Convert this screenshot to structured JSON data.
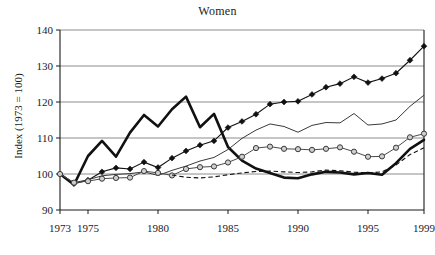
{
  "chart_data": {
    "type": "line",
    "title": "Women",
    "xlabel": "",
    "ylabel": "Index (1973 = 100)",
    "xlim": [
      1973,
      1999
    ],
    "ylim": [
      90,
      140
    ],
    "grid": true,
    "legend": "none",
    "y_ticks": [
      "90",
      "100",
      "110",
      "120",
      "130",
      "140"
    ],
    "x_ticks": [
      "1973",
      "1975",
      "1980",
      "1985",
      "1990",
      "1995",
      "1999"
    ],
    "x": [
      1973,
      1974,
      1975,
      1976,
      1977,
      1978,
      1979,
      1980,
      1981,
      1982,
      1983,
      1984,
      1985,
      1986,
      1987,
      1988,
      1989,
      1990,
      1991,
      1992,
      1993,
      1994,
      1995,
      1996,
      1997,
      1998,
      1999
    ],
    "series": [
      {
        "name": "thick-solid",
        "marker": "none",
        "color": "#111111",
        "values": [
          100.0,
          97.0,
          105.0,
          109.2,
          104.8,
          111.5,
          116.4,
          113.2,
          118.0,
          121.5,
          113.0,
          116.7,
          107.5,
          103.7,
          101.5,
          100.3,
          99.0,
          98.8,
          99.9,
          100.6,
          100.4,
          99.9,
          100.3,
          99.8,
          103.0,
          107.0,
          109.5
        ]
      },
      {
        "name": "filled-diamond",
        "marker": "diamond",
        "color": "#111111",
        "values": [
          100.0,
          97.3,
          98.3,
          100.6,
          101.7,
          101.4,
          103.3,
          101.8,
          104.4,
          106.4,
          108.0,
          109.2,
          112.9,
          114.6,
          116.6,
          119.4,
          120.0,
          120.2,
          122.1,
          124.1,
          125.1,
          127.0,
          125.4,
          126.5,
          128.0,
          131.6,
          135.5
        ]
      },
      {
        "name": "thin-solid",
        "marker": "none",
        "color": "#3a3a3a",
        "values": [
          100.0,
          97.6,
          98.4,
          99.5,
          99.9,
          100.1,
          100.6,
          99.6,
          101.0,
          102.2,
          103.6,
          104.6,
          106.8,
          109.9,
          112.2,
          113.9,
          113.2,
          111.6,
          113.5,
          114.3,
          114.2,
          116.8,
          113.6,
          113.9,
          115.0,
          118.8,
          121.9
        ]
      },
      {
        "name": "open-circle",
        "marker": "circle",
        "color": "#4a4a4a",
        "values": [
          100.0,
          97.6,
          98.0,
          98.7,
          98.9,
          99.0,
          100.8,
          100.3,
          99.6,
          101.4,
          101.9,
          102.1,
          103.2,
          104.8,
          107.2,
          107.6,
          107.0,
          106.9,
          106.7,
          107.0,
          107.4,
          106.2,
          104.8,
          104.9,
          107.3,
          110.2,
          111.2
        ]
      },
      {
        "name": "dashed",
        "marker": "none",
        "color": "#111111",
        "values": [
          null,
          null,
          null,
          null,
          null,
          null,
          null,
          null,
          99.7,
          99.1,
          98.9,
          99.2,
          99.8,
          100.3,
          100.7,
          100.8,
          100.6,
          100.4,
          100.6,
          101.1,
          100.9,
          100.5,
          100.3,
          100.6,
          102.5,
          105.4,
          107.3
        ]
      }
    ]
  }
}
